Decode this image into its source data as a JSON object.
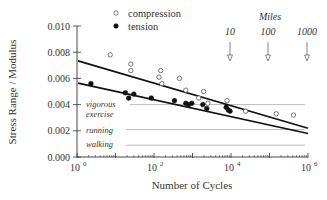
{
  "chart_data": {
    "type": "scatter",
    "title": "",
    "xlabel": "Number of Cycles",
    "ylabel": "Stress Range / Modulus",
    "xscale": "log",
    "xlim": [
      1,
      1000000
    ],
    "ylim": [
      0.0,
      0.01
    ],
    "x_ticks": [
      {
        "value": 1,
        "label": "10",
        "exp": "0"
      },
      {
        "value": 100,
        "label": "10",
        "exp": "2"
      },
      {
        "value": 10000,
        "label": "10",
        "exp": "4"
      },
      {
        "value": 1000000,
        "label": "10",
        "exp": "6"
      }
    ],
    "y_ticks": [
      "0.000",
      "0.002",
      "0.004",
      "0.006",
      "0.008",
      "0.010"
    ],
    "y_tick_values": [
      0,
      0.002,
      0.004,
      0.006,
      0.008,
      0.01
    ],
    "legend": {
      "position": "top",
      "entries": [
        {
          "label": "compression",
          "marker": "open-circle"
        },
        {
          "label": "tension",
          "marker": "filled-circle"
        }
      ]
    },
    "series": [
      {
        "name": "compression",
        "marker": "open-circle",
        "points": [
          [
            7.3,
            0.0078
          ],
          [
            25,
            0.0071
          ],
          [
            25,
            0.0066
          ],
          [
            135,
            0.0061
          ],
          [
            150,
            0.0066
          ],
          [
            160,
            0.0056
          ],
          [
            460,
            0.006
          ],
          [
            670,
            0.0051
          ],
          [
            1450,
            0.0045
          ],
          [
            1950,
            0.005
          ],
          [
            2500,
            0.0041
          ],
          [
            7900,
            0.0043
          ],
          [
            24000,
            0.0035
          ],
          [
            150000,
            0.0033
          ],
          [
            420000,
            0.0032
          ]
        ],
        "fit": {
          "from": [
            1,
            0.0074
          ],
          "to": [
            1000000,
            0.0022
          ]
        }
      },
      {
        "name": "tension",
        "marker": "filled-circle",
        "points": [
          [
            2.3,
            0.0056
          ],
          [
            18,
            0.0049
          ],
          [
            22,
            0.0045
          ],
          [
            30,
            0.0048
          ],
          [
            85,
            0.0045
          ],
          [
            340,
            0.0043
          ],
          [
            670,
            0.0041
          ],
          [
            800,
            0.004
          ],
          [
            960,
            0.0041
          ],
          [
            1850,
            0.004
          ],
          [
            2350,
            0.0037
          ],
          [
            7500,
            0.0038
          ],
          [
            8400,
            0.0036
          ],
          [
            9400,
            0.0035
          ]
        ],
        "fit": {
          "from": [
            1,
            0.0057
          ],
          "to": [
            1000000,
            0.0018
          ]
        }
      }
    ],
    "reference_lines": [
      {
        "label": "vigorous exercise",
        "value": 0.004
      },
      {
        "label": "running",
        "value": 0.0021
      },
      {
        "label": "walking",
        "value": 0.0009
      }
    ],
    "annotations": {
      "miles_title": "Miles",
      "miles": [
        {
          "label": "10",
          "cycles": 10000
        },
        {
          "label": "100",
          "cycles": 100000
        },
        {
          "label": "1000",
          "cycles": 1000000
        }
      ]
    },
    "grid": false
  },
  "labels": {
    "vigorous_1": "vigorous",
    "vigorous_2": "exercise",
    "running": "running",
    "walking": "walking"
  }
}
